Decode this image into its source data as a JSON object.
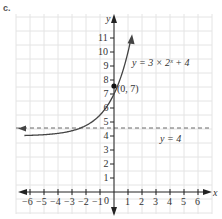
{
  "part_label": "c.",
  "chart_data": {
    "type": "line",
    "title": "",
    "xlabel": "x",
    "ylabel": "y",
    "xlim": [
      -7,
      7
    ],
    "ylim": [
      -1,
      12
    ],
    "grid": true,
    "x_ticks": [
      "-6",
      "-5",
      "-4",
      "-3",
      "-2",
      "-1",
      "1",
      "2",
      "3",
      "4",
      "5",
      "6"
    ],
    "y_ticks": [
      "1",
      "2",
      "3",
      "4",
      "5",
      "6",
      "7",
      "8",
      "9",
      "10",
      "11"
    ],
    "origin_label": "0",
    "series": [
      {
        "name": "y = 3 × 2^x + 4",
        "label": "y = 3 × 2ˣ + 4",
        "function": "3*2^x+4",
        "x": [
          -6.5,
          -6,
          -5,
          -4,
          -3,
          -2,
          -1,
          0,
          0.5,
          1,
          1.2
        ],
        "values": [
          4.03,
          4.05,
          4.09,
          4.19,
          4.38,
          4.75,
          5.5,
          7,
          8.24,
          10,
          10.89
        ]
      }
    ],
    "asymptote": {
      "label": "y = 4",
      "y": 4,
      "style": "dashed"
    },
    "annotations": [
      {
        "text": "(0, 7)",
        "x": 0,
        "y": 7,
        "marker": "filled-dot"
      }
    ]
  }
}
